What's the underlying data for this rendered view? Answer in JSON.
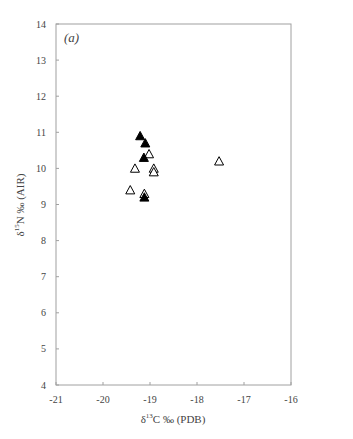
{
  "chart_data": {
    "type": "scatter",
    "title": "",
    "panel_label": "(a)",
    "xlabel": "δ13C ‰ (PDB)",
    "xlabel_parts": {
      "delta": "δ",
      "sup": "13",
      "rest": "C ‰ (PDB)"
    },
    "ylabel": "δ15N ‰ (AIR)",
    "ylabel_parts": {
      "delta": "δ",
      "sup": "15",
      "rest": "N ‰ (AIR)"
    },
    "xlim": [
      -21,
      -16
    ],
    "ylim": [
      4,
      14
    ],
    "x_ticks": [
      -21,
      -20,
      -19,
      -18,
      -17,
      -16
    ],
    "x_tick_labels": [
      "-21",
      "-20",
      "-19",
      "-18",
      "-17",
      "-16"
    ],
    "y_ticks": [
      4,
      5,
      6,
      7,
      8,
      9,
      10,
      11,
      12,
      13,
      14
    ],
    "y_tick_labels": [
      "4",
      "5",
      "6",
      "7",
      "8",
      "9",
      "10",
      "11",
      "12",
      "13",
      "14"
    ],
    "grid": false,
    "legend": null,
    "series": [
      {
        "name": "filled triangles",
        "marker": "filled-triangle",
        "color": "#000000",
        "points": [
          {
            "x": -19.21,
            "y": 10.9
          },
          {
            "x": -19.1,
            "y": 10.7
          },
          {
            "x": -19.13,
            "y": 10.3
          },
          {
            "x": -19.12,
            "y": 9.2
          }
        ]
      },
      {
        "name": "open triangles",
        "marker": "open-triangle",
        "color": "#000000",
        "points": [
          {
            "x": -19.02,
            "y": 10.4
          },
          {
            "x": -19.32,
            "y": 10.0
          },
          {
            "x": -18.92,
            "y": 10.0
          },
          {
            "x": -18.92,
            "y": 9.9
          },
          {
            "x": -19.42,
            "y": 9.4
          },
          {
            "x": -19.12,
            "y": 9.3
          },
          {
            "x": -17.53,
            "y": 10.2
          }
        ]
      }
    ]
  },
  "colors": {
    "axis": "#a0a0a0",
    "text": "#444444",
    "marker": "#000000"
  }
}
